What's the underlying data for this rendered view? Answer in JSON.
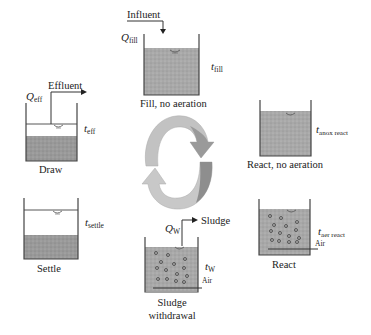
{
  "diagram": {
    "type": "sequencing batch reactor cycle",
    "colors": {
      "liquid": "#a9a9a9",
      "sludge": "#9a9a9a",
      "outline": "#444444",
      "arrow_light": "#c8c8c8",
      "arrow_dark": "#8e8e8e"
    },
    "stages": {
      "fill": {
        "caption": "Fill, no aeration",
        "flow_label": "Influent",
        "q_sym": "Q",
        "q_sub": "fill",
        "t_sym": "t",
        "t_sub": "fill"
      },
      "anox": {
        "caption": "React, no aeration",
        "t_sym": "t",
        "t_sub": "anox react"
      },
      "react": {
        "caption": "React",
        "t_sym": "t",
        "t_sub": "aer react",
        "air_label": "Air"
      },
      "withdrawal": {
        "caption_line1": "Sludge",
        "caption_line2": "withdrawal",
        "flow_label": "Sludge",
        "q_sym": "Q",
        "q_sub": "W",
        "t_sym": "t",
        "t_sub": "W",
        "air_label": "Air"
      },
      "settle": {
        "caption": "Settle",
        "t_sym": "t",
        "t_sub": "settle"
      },
      "draw": {
        "caption": "Draw",
        "flow_label": "Effluent",
        "q_sym": "Q",
        "q_sub": "eff",
        "t_sym": "t",
        "t_sub": "eff"
      }
    }
  }
}
